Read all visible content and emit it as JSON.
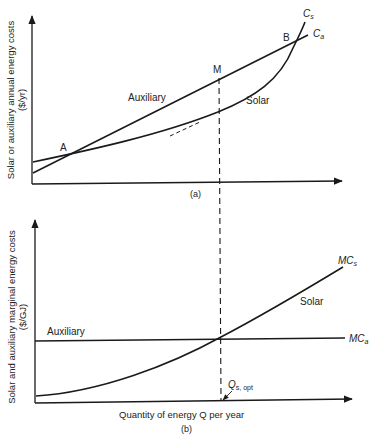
{
  "panel_a": {
    "caption": "(a)",
    "y_axis_title_line1": "Solar or auxiliary annual energy costs",
    "y_axis_title_line2": "($/yr)",
    "curves": {
      "auxiliary_label": "Auxiliary",
      "solar_label": "Solar",
      "cs_label_main": "C",
      "cs_label_sub": "s",
      "ca_label_main": "C",
      "ca_label_sub": "a"
    },
    "points": {
      "a": "A",
      "b": "B",
      "m": "M"
    }
  },
  "panel_b": {
    "caption": "(b)",
    "y_axis_title_line1": "Solar and auxiliary marginal energy costs",
    "y_axis_title_line2": "($/GJ)",
    "x_axis_title": "Quantity of energy Q per year",
    "curves": {
      "auxiliary_label": "Auxiliary",
      "solar_label": "Solar",
      "mcs_label_main": "MC",
      "mcs_label_sub": "s",
      "mca_label_main": "MC",
      "mca_label_sub": "a"
    },
    "optimum": {
      "label_main": "Q",
      "label_sub": "s, opt"
    }
  },
  "colors": {
    "ink": "#1a1a1a",
    "background": "#ffffff"
  }
}
